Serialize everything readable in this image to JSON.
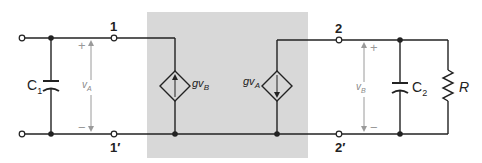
{
  "diagram": {
    "type": "circuit-schematic",
    "colors": {
      "wire": "#222222",
      "shaded_box": "#d8d8d8",
      "voltage_arrow": "#9a9a9a",
      "background": "#ffffff"
    },
    "terminals": {
      "t1": "1",
      "t1p": "1′",
      "t2": "2",
      "t2p": "2′"
    },
    "components": {
      "c1": {
        "name": "C",
        "sub": "1"
      },
      "c2": {
        "name": "C",
        "sub": "2"
      },
      "r": {
        "name": "R"
      },
      "source_left": {
        "name": "gv",
        "sub": "B",
        "direction": "up"
      },
      "source_right": {
        "name": "gv",
        "sub": "A",
        "direction": "down"
      }
    },
    "voltages": {
      "va": {
        "name": "v",
        "sub": "A",
        "plus": "+",
        "minus": "−"
      },
      "vb": {
        "name": "v",
        "sub": "B",
        "plus": "+",
        "minus": "−"
      }
    }
  }
}
